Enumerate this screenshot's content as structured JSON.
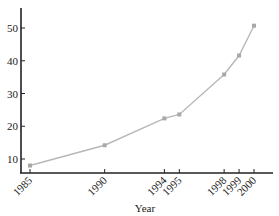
{
  "chart_data": {
    "type": "line",
    "title": "",
    "xlabel": "Year",
    "ylabel": "",
    "x": [
      1985,
      1990,
      1994,
      1995,
      1998,
      1999,
      2000
    ],
    "categories": [
      "1985",
      "1990",
      "1994",
      "1995",
      "1998",
      "1999",
      "2000"
    ],
    "values": [
      8,
      14.2,
      22.4,
      23.6,
      35.8,
      41.6,
      50.7
    ],
    "yticks": [
      10,
      20,
      30,
      40,
      50
    ],
    "ylim": [
      6.4,
      56
    ],
    "xlim": [
      1984.4,
      2001.2
    ],
    "grid": false,
    "legend": null,
    "colors": {
      "line": "#b8b8b8",
      "marker": "#a8a8a8",
      "axis": "#222222"
    }
  }
}
